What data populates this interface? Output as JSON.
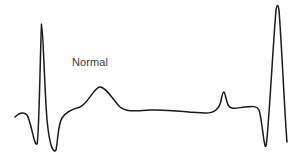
{
  "diagram": {
    "label": "Normal",
    "trace_color": "#1a1a1a",
    "label_color": "#3a3a3a",
    "waveform": "ECG trace: Q-R-S complex, T wave, baseline, small P wave, then a tall inverted/upright spike",
    "path": "M15,117 C18,114 23,111 27,115 C31,121 34,146 37,144 C39,140 40,60 41.5,24 C43,24 44,80 47,120 C50,150 54,153 56,150 C58,140 58,124 62,118 C66,112 72,109 80,107 C88,104 94,87 100,87 C106,87 113,100 120,107 C126,112 134,111 151,110 C170,109 190,113 205,113 C215,113 219,109 221,101 C222,95 223,92 224,92 C225,92 226,100 228,105 C231,110 236,108 245,107 C253,106 257,106 259,110 C262,118 264,150 266,146 C268,140 272,60 276,10 C277,4 278,4 279,10 C282,50 285,120 287,142"
  }
}
